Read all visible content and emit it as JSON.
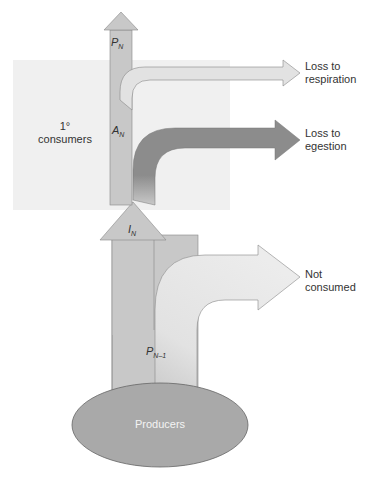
{
  "diagram": {
    "box_label": "1°\nconsumers",
    "box_label_line1": "1°",
    "box_label_line2": "consumers",
    "producers_label": "Producers",
    "symbols": {
      "pn": {
        "base": "P",
        "sub": "N"
      },
      "an": {
        "base": "A",
        "sub": "N"
      },
      "in": {
        "base": "I",
        "sub": "N"
      },
      "pn1": {
        "base": "P",
        "sub": "N–1"
      }
    },
    "arrows": [
      {
        "id": "respiration",
        "label_line1": "Loss to",
        "label_line2": "respiration"
      },
      {
        "id": "egestion",
        "label_line1": "Loss to",
        "label_line2": "egestion"
      },
      {
        "id": "not-consumed",
        "label_line1": "Not",
        "label_line2": "consumed"
      }
    ],
    "colors": {
      "box": "#f0f0f0",
      "stem": "#c8c8c8",
      "light_arrow": "#e2e2e2",
      "dark_arrow": "#8c8c8c",
      "ellipse": "#a9a9a9",
      "outline": "#6e6e6e"
    }
  }
}
